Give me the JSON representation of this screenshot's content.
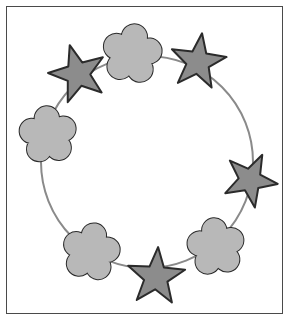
{
  "figure": {
    "width": 291,
    "height": 322,
    "background_color": "#ffffff",
    "frame": {
      "name": "border-frame",
      "x": 6,
      "y": 6,
      "width": 277,
      "height": 308,
      "stroke_color": "#4a4a4a",
      "stroke_width": 1,
      "fill_color": "#ffffff"
    },
    "guide_circle": {
      "name": "guide-circle",
      "center_x": 147,
      "center_y": 162,
      "radius": 106,
      "stroke_color": "#8a8a8a",
      "stroke_width": 2,
      "fill": "none"
    },
    "colors": {
      "star_fill": "#8c8c8c",
      "star_stroke": "#2b2b2b",
      "flower_fill": "#b8b8b8",
      "flower_stroke": "#2b2b2b",
      "circle_stroke": "#8a8a8a",
      "frame_stroke": "#4a4a4a",
      "page_background": "#ffffff"
    },
    "shape_stroke_width": 2,
    "sequence_description": "Eight shapes evenly spaced around a circle, alternating flower, star, flower, star",
    "shape_count": 8,
    "star_count": 4,
    "flower_count": 4,
    "shapes": [
      {
        "index": 0,
        "kind": "flower",
        "label": "flower-top",
        "angle_deg": -72,
        "cx": 132,
        "cy": 54,
        "size": 30,
        "rotation_deg": 8,
        "fill": "#b8b8b8",
        "stroke": "#2b2b2b"
      },
      {
        "index": 1,
        "kind": "star",
        "label": "star-top-right",
        "angle_deg": -30,
        "cx": 198,
        "cy": 62,
        "size": 29,
        "rotation_deg": 8,
        "fill": "#8c8c8c",
        "stroke": "#2b2b2b"
      },
      {
        "index": 2,
        "kind": "star",
        "label": "star-right",
        "angle_deg": 24,
        "cx": 250,
        "cy": 180,
        "size": 28,
        "rotation_deg": 26,
        "fill": "#8c8c8c",
        "stroke": "#2b2b2b"
      },
      {
        "index": 3,
        "kind": "flower",
        "label": "flower-bottom-right",
        "angle_deg": 62,
        "cx": 216,
        "cy": 247,
        "size": 29,
        "rotation_deg": -6,
        "fill": "#b8b8b8",
        "stroke": "#2b2b2b"
      },
      {
        "index": 4,
        "kind": "star",
        "label": "star-bottom",
        "angle_deg": 100,
        "cx": 156,
        "cy": 277,
        "size": 30,
        "rotation_deg": 4,
        "fill": "#8c8c8c",
        "stroke": "#2b2b2b"
      },
      {
        "index": 5,
        "kind": "flower",
        "label": "flower-bottom-left",
        "angle_deg": 140,
        "cx": 91,
        "cy": 252,
        "size": 29,
        "rotation_deg": 10,
        "fill": "#b8b8b8",
        "stroke": "#2b2b2b"
      },
      {
        "index": 6,
        "kind": "flower",
        "label": "flower-left",
        "angle_deg": 186,
        "cx": 48,
        "cy": 135,
        "size": 29,
        "rotation_deg": -4,
        "fill": "#b8b8b8",
        "stroke": "#2b2b2b"
      },
      {
        "index": 7,
        "kind": "star",
        "label": "star-top-left",
        "angle_deg": -128,
        "cx": 78,
        "cy": 74,
        "size": 30,
        "rotation_deg": -16,
        "fill": "#8c8c8c",
        "stroke": "#2b2b2b"
      }
    ]
  }
}
